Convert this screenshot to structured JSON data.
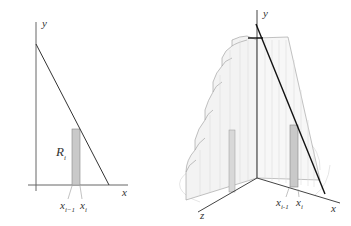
{
  "left_figure": {
    "y_axis_label": "y",
    "x_axis_label": "x",
    "region_label": "R",
    "region_label_sub": "i",
    "tick_left_label": "x",
    "tick_left_sub": "i−1",
    "tick_right_label": "x",
    "tick_right_sub": "i"
  },
  "right_figure": {
    "y_axis_label": "y",
    "x_axis_label": "x",
    "z_axis_label": "z",
    "tick_left_label": "x",
    "tick_left_sub": "i-1",
    "tick_right_label": "x",
    "tick_right_sub": "i"
  },
  "colors": {
    "axis": "#555555",
    "line": "#222222",
    "strip_fill": "#c8c8c8",
    "solid_fill": "#f2f2f2",
    "solid_edge": "#aaaaaa"
  }
}
